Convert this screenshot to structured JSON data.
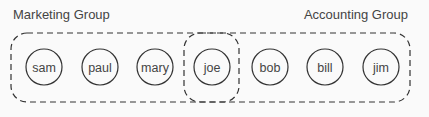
{
  "groups": [
    {
      "name": "Marketing Group",
      "members": [
        "sam",
        "paul",
        "mary",
        "joe"
      ]
    },
    {
      "name": "Accounting Group",
      "members": [
        "joe",
        "bob",
        "bill",
        "jim"
      ]
    }
  ],
  "nodes": [
    {
      "label": "sam",
      "cx": 44
    },
    {
      "label": "paul",
      "cx": 100
    },
    {
      "label": "mary",
      "cx": 155
    },
    {
      "label": "joe",
      "cx": 212
    },
    {
      "label": "bob",
      "cx": 270
    },
    {
      "label": "bill",
      "cx": 325
    },
    {
      "label": "jim",
      "cx": 381
    }
  ],
  "colors": {
    "stroke": "#333333",
    "text": "#444444",
    "background": "#fafafa"
  }
}
